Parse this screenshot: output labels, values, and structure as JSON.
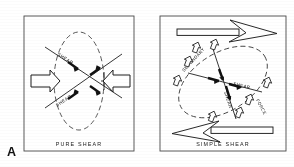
{
  "figure": {
    "label": "A",
    "background_color": "#ffffff",
    "ink_color": "#1a1a1a",
    "line_color": "#2b2b2b"
  },
  "panels": [
    {
      "id": "pure-shear",
      "caption": "PURE  SHEAR",
      "ellipse_style": "dashed",
      "ellipse_orientation": "vertical",
      "shear_labels": [
        "SHEAR",
        "SHEAR"
      ],
      "block_arrows": [
        {
          "name": "compression-arrow-left",
          "direction": "right"
        },
        {
          "name": "compression-arrow-right",
          "direction": "left"
        }
      ],
      "sense_arrow_count": 4
    },
    {
      "id": "simple-shear",
      "caption": "SIMPLE  SHEAR",
      "ellipse_style": "dashed",
      "ellipse_orientation": "tilted",
      "shear_labels": [
        "SHEAR",
        "SHEAR"
      ],
      "secondary_label": "SECONDARY",
      "force_label": "FORCE",
      "couple_arrows": [
        {
          "name": "couple-arrow-top",
          "direction": "right"
        },
        {
          "name": "couple-arrow-bottom",
          "direction": "left"
        }
      ],
      "small_arrow_count": 8,
      "sense_arrow_count": 4
    }
  ]
}
